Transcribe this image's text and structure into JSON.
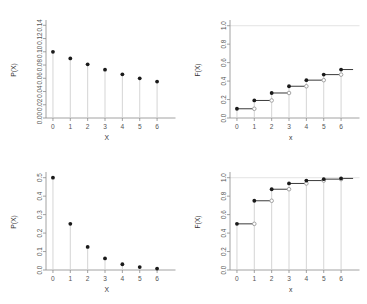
{
  "figure": {
    "layout": "2x2 grid of statistical plots",
    "background": "#ffffff",
    "marker_filled_color": "#1a1a1a",
    "marker_open_color": "#9a9a9a",
    "stem_color": "#d0d0d0",
    "axis_color": "#8c8c8c",
    "step_line_color": "#3a3a3a",
    "gridline_color": "#d8d8d8",
    "tick_text_color": "#555555"
  },
  "panels": [
    {
      "id": "top-left",
      "name": "pmf-slow-decay",
      "chart_data": {
        "type": "scatter",
        "title": "",
        "xlabel": "X",
        "ylabel": "P(X)",
        "x": [
          0,
          1,
          2,
          3,
          4,
          5,
          6
        ],
        "values": [
          0.1,
          0.09,
          0.081,
          0.073,
          0.066,
          0.06,
          0.055
        ],
        "xticks": [
          "0",
          "1",
          "2",
          "3",
          "4",
          "5",
          "6"
        ],
        "yticks": [
          "0.00",
          "0.02",
          "0.04",
          "0.06",
          "0.08",
          "0.10",
          "0.12",
          "0.14"
        ],
        "ytickvals": [
          0.0,
          0.02,
          0.04,
          0.06,
          0.08,
          0.1,
          0.12,
          0.14
        ],
        "xlim": [
          -0.4,
          6.6
        ],
        "ylim": [
          0.0,
          0.145
        ],
        "grid": false,
        "stems": true,
        "legend": "none"
      }
    },
    {
      "id": "top-right",
      "name": "cdf-slow-decay",
      "chart_data": {
        "type": "line",
        "title": "",
        "xlabel": "x",
        "ylabel": "F(X)",
        "x": [
          0,
          1,
          2,
          3,
          4,
          5,
          6
        ],
        "values": [
          0.1,
          0.19,
          0.271,
          0.344,
          0.41,
          0.47,
          0.525
        ],
        "xticks": [
          "0",
          "1",
          "2",
          "3",
          "4",
          "5",
          "6"
        ],
        "yticks": [
          "0.0",
          "0.2",
          "0.4",
          "0.6",
          "0.8",
          "1.0"
        ],
        "ytickvals": [
          0.0,
          0.2,
          0.4,
          0.6,
          0.8,
          1.0
        ],
        "xlim": [
          -0.4,
          6.6
        ],
        "ylim": [
          0.0,
          1.04
        ],
        "grid": false,
        "reference_line_y": 1.0,
        "step_style": "filled circle at step start, open circle at step end",
        "legend": "none"
      }
    },
    {
      "id": "bottom-left",
      "name": "pmf-geometric",
      "chart_data": {
        "type": "scatter",
        "title": "",
        "xlabel": "X",
        "ylabel": "P(X)",
        "x": [
          0,
          1,
          2,
          3,
          4,
          5,
          6
        ],
        "values": [
          0.5,
          0.25,
          0.125,
          0.0625,
          0.03125,
          0.015625,
          0.0078125
        ],
        "xticks": [
          "0",
          "1",
          "2",
          "3",
          "4",
          "5",
          "6"
        ],
        "yticks": [
          "0.0",
          "0.1",
          "0.2",
          "0.3",
          "0.4",
          "0.5"
        ],
        "ytickvals": [
          0.0,
          0.1,
          0.2,
          0.3,
          0.4,
          0.5
        ],
        "xlim": [
          -0.4,
          6.6
        ],
        "ylim": [
          0.0,
          0.52
        ],
        "grid": false,
        "stems": true,
        "legend": "none"
      }
    },
    {
      "id": "bottom-right",
      "name": "cdf-geometric",
      "chart_data": {
        "type": "line",
        "title": "",
        "xlabel": "x",
        "ylabel": "F(X)",
        "x": [
          0,
          1,
          2,
          3,
          4,
          5,
          6
        ],
        "values": [
          0.5,
          0.75,
          0.875,
          0.9375,
          0.96875,
          0.984375,
          0.9921875
        ],
        "xticks": [
          "0",
          "1",
          "2",
          "3",
          "4",
          "5",
          "6"
        ],
        "yticks": [
          "0.0",
          "0.2",
          "0.4",
          "0.6",
          "0.8",
          "1.0"
        ],
        "ytickvals": [
          0.0,
          0.2,
          0.4,
          0.6,
          0.8,
          1.0
        ],
        "xlim": [
          -0.4,
          6.6
        ],
        "ylim": [
          0.0,
          1.04
        ],
        "grid": false,
        "reference_line_y": 1.0,
        "step_style": "filled circle at step start, open circle at step end",
        "legend": "none"
      }
    }
  ]
}
